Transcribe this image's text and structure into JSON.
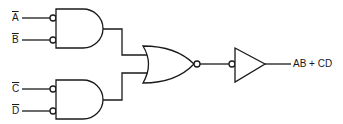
{
  "diagram": {
    "type": "logic-circuit",
    "inputs": [
      {
        "id": "A",
        "label": "A",
        "inverted": true
      },
      {
        "id": "B",
        "label": "B",
        "inverted": true
      },
      {
        "id": "C",
        "label": "C",
        "inverted": true
      },
      {
        "id": "D",
        "label": "D",
        "inverted": true
      }
    ],
    "gates": [
      {
        "id": "and1",
        "type": "AND",
        "inverted_inputs": true,
        "inputs": [
          "A",
          "B"
        ]
      },
      {
        "id": "and2",
        "type": "AND",
        "inverted_inputs": true,
        "inputs": [
          "C",
          "D"
        ]
      },
      {
        "id": "nor1",
        "type": "NOR",
        "inputs": [
          "and1",
          "and2"
        ]
      },
      {
        "id": "buf1",
        "type": "BUFFER",
        "inverted_input": true,
        "inputs": [
          "nor1"
        ]
      }
    ],
    "output": {
      "label": "AB + CD"
    }
  },
  "colors": {
    "line": "#1a1a1a",
    "background": "#ffffff"
  }
}
